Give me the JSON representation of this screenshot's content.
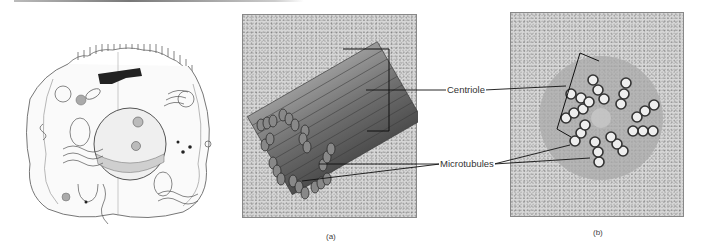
{
  "figure": {
    "panels": [
      {
        "id": "cell",
        "description": "Animal cell cross-section line drawing"
      },
      {
        "id": "a",
        "caption": "(a)",
        "description": "3D illustration of centriole cylinder composed of microtubule triplets"
      },
      {
        "id": "b",
        "caption": "(b)",
        "description": "Electron micrograph-style cross-section of centriole showing nine microtubule triplets"
      }
    ],
    "labels": {
      "centriole": "Centriole",
      "microtubules": "Microtubules"
    },
    "captions": {
      "a": "(a)",
      "b": "(b)"
    }
  }
}
